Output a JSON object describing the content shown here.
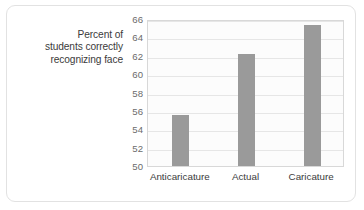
{
  "chart_data": {
    "type": "bar",
    "title": "",
    "xlabel": "",
    "ylabel": "Percent of students correctly recognizing face",
    "ylabel_lines": [
      "Percent of",
      "students correctly",
      "recognizing face"
    ],
    "categories": [
      "Anticaricature",
      "Actual",
      "Caricature"
    ],
    "values": [
      55.5,
      62.2,
      65.3
    ],
    "ylim": [
      50,
      66
    ],
    "yticks": [
      50,
      52,
      54,
      56,
      58,
      60,
      62,
      64,
      66
    ],
    "ytick_labels": [
      "50",
      "52",
      "54",
      "56",
      "58",
      "60",
      "62",
      "64",
      "66"
    ],
    "grid": "horizontal",
    "legend": "none",
    "bar_color": "#9a9a9a",
    "plot_background": "#fcfcfc",
    "gridline_color": "#e6e6e6",
    "axis_text_color": "#6b6b6b",
    "title_text_color": "#3b3b3b",
    "frame_border_color": "#e2e2e2"
  }
}
